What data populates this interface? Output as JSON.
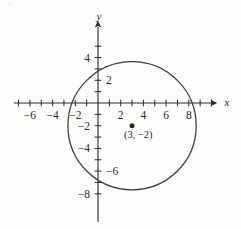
{
  "figure": {
    "title": "",
    "background_color": "#fdfdfb",
    "ink_color": "#2b2b2b",
    "width": 241,
    "height": 229,
    "corner_mark": "c"
  },
  "axes": {
    "x_label": "x",
    "y_label": "y",
    "origin_px": {
      "x": 98,
      "y": 103
    },
    "unit_px": 11.35,
    "x_range": [
      -7.4,
      10.6
    ],
    "y_range": [
      -9.3,
      7.6
    ],
    "x_tick_values": [
      -7,
      -6,
      -5,
      -4,
      -3,
      -2,
      -1,
      1,
      2,
      3,
      4,
      5,
      6,
      7,
      8,
      9,
      10
    ],
    "y_tick_values": [
      5,
      4,
      3,
      2,
      1,
      -1,
      -2,
      -3,
      -4,
      -5,
      -6,
      -7,
      -8
    ],
    "x_tick_labels": [
      {
        "value": -6,
        "text": "−6"
      },
      {
        "value": -4,
        "text": "−4"
      },
      {
        "value": -2,
        "text": "−2"
      },
      {
        "value": 2,
        "text": "2"
      },
      {
        "value": 4,
        "text": "4"
      },
      {
        "value": 6,
        "text": "6"
      },
      {
        "value": 8,
        "text": "8"
      }
    ],
    "y_tick_labels": [
      {
        "value": 4,
        "text": "4",
        "side": "left"
      },
      {
        "value": 2,
        "text": "2",
        "side": "right"
      },
      {
        "value": -2,
        "text": "−2",
        "side": "left"
      },
      {
        "value": -4,
        "text": "−4",
        "side": "left"
      },
      {
        "value": -6,
        "text": "−6",
        "side": "right"
      },
      {
        "value": -8,
        "text": "−8",
        "side": "left"
      }
    ]
  },
  "chart_data": {
    "type": "scatter",
    "title": "",
    "xlabel": "x",
    "ylabel": "y",
    "xlim": [
      -7.4,
      10.6
    ],
    "ylim": [
      -9.3,
      7.6
    ],
    "grid": false,
    "legend": "none",
    "shapes": [
      {
        "kind": "circle",
        "center": [
          3,
          -2
        ],
        "radius": 5.65,
        "stroke": "#3a3a3a",
        "fill": "none",
        "label": ""
      }
    ],
    "points": [
      {
        "x": 3,
        "y": -2,
        "label": "(3, −2)",
        "marker": "filled-dot",
        "color": "#262626"
      }
    ],
    "annotations": [
      {
        "text": "(3, −2)",
        "x": 3.55,
        "y": -3.05
      }
    ]
  }
}
